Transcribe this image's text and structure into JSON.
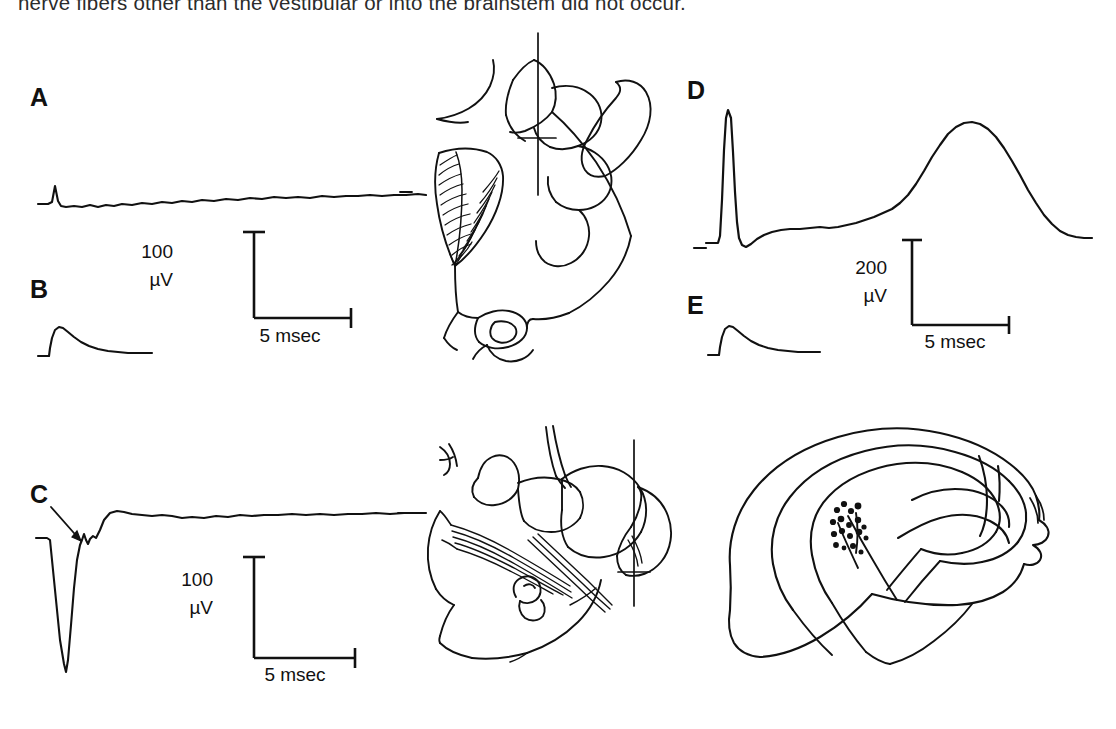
{
  "figure": {
    "caption_fragment": "nerve fibers other than the vestibular or into the brainstem did not occur.",
    "background_color": "#ffffff",
    "trace_color": "#111111",
    "panel_count": 5,
    "diagram_count": 3
  },
  "panels": [
    {
      "id": "A",
      "letter": "A",
      "description": "flat electrophysiological trace with small initial stimulus artifact spike",
      "waveform_type": "flat-with-spike"
    },
    {
      "id": "B",
      "letter": "B",
      "description": "small fast-rising slow-decaying positive wave",
      "waveform_type": "rise-decay"
    },
    {
      "id": "C",
      "letter": "C",
      "description": "large downward stimulus artifact deflection with arrow marking a notch on the recovery",
      "waveform_type": "large-negative-spike",
      "annotation": "arrow"
    },
    {
      "id": "D",
      "letter": "D",
      "description": "tall narrow stimulus artifact followed by a large broad slow positive field potential",
      "waveform_type": "spike-then-slow-wave"
    },
    {
      "id": "E",
      "letter": "E",
      "description": "small fast-rising slow-decaying positive wave",
      "waveform_type": "rise-decay"
    }
  ],
  "scale_bars": [
    {
      "id": "scale-a",
      "for_panel": "A",
      "amplitude_value": "100",
      "amplitude_unit": "µV",
      "time_value": "5 msec"
    },
    {
      "id": "scale-c",
      "for_panel": "C",
      "amplitude_value": "100",
      "amplitude_unit": "µV",
      "time_value": "5 msec"
    },
    {
      "id": "scale-d",
      "for_panel": "D",
      "amplitude_value": "200",
      "amplitude_unit": "µV",
      "time_value": "5 msec"
    }
  ],
  "diagrams": [
    {
      "id": "brainstem-section-upper",
      "label": "upper brainstem and cerebellum cross-section with electrode track",
      "has_electrode_track": true,
      "has_lesion_marker": true
    },
    {
      "id": "brainstem-section-lower",
      "label": "lower brainstem section with nerve root fibers and electrode track",
      "has_electrode_track": true,
      "has_lesion_marker": true
    },
    {
      "id": "cerebellar-surface-map",
      "label": "cerebellar surface outline with cluster of recording site dots",
      "has_electrode_track": false,
      "recording_dot_count": 18
    }
  ]
}
